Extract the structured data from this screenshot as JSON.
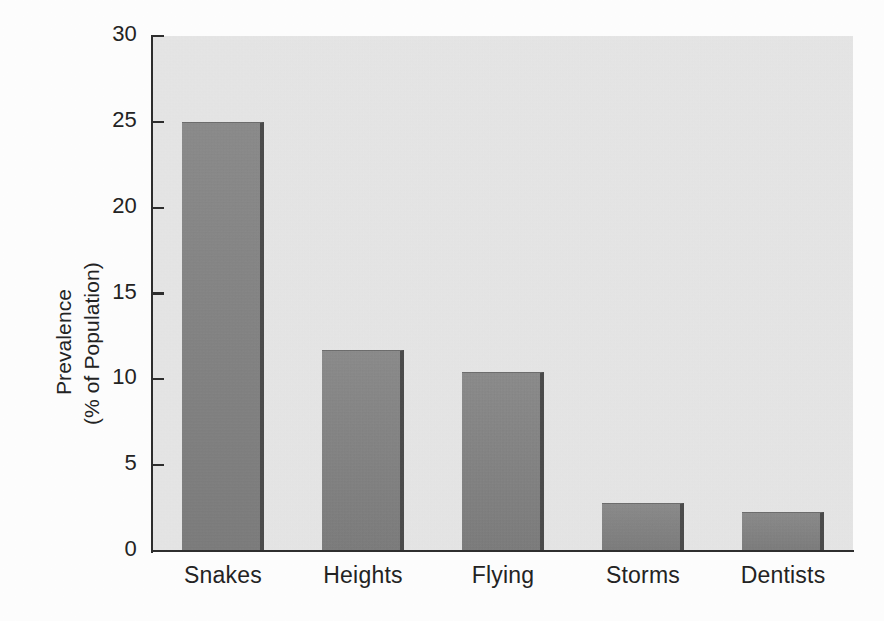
{
  "chart_data": {
    "type": "bar",
    "title": "",
    "subtitle": "",
    "xlabel": "",
    "ylabel": "Prevalence (% of Population)",
    "ylabel_lines": [
      "Prevalence",
      "(% of Population)"
    ],
    "categories": [
      "Snakes",
      "Heights",
      "Flying",
      "Storms",
      "Dentists"
    ],
    "values": [
      25.0,
      11.7,
      10.4,
      2.8,
      2.3
    ],
    "ylim": [
      0,
      30
    ],
    "ytick_labels": [
      "0",
      "5",
      "10",
      "15",
      "20",
      "25",
      "30"
    ],
    "ytick_values": [
      0,
      5,
      10,
      15,
      20,
      25,
      30
    ],
    "grid": false,
    "legend": false,
    "legend_position": "none",
    "annotations": [],
    "colors": {
      "bar_fill": "#888888",
      "bar_edge_shadow": "#4b4b4b",
      "plot_background": "#e9e9e9",
      "axis_line": "#2e2e2e",
      "text": "#232323",
      "page_background": "#fefefe"
    }
  }
}
